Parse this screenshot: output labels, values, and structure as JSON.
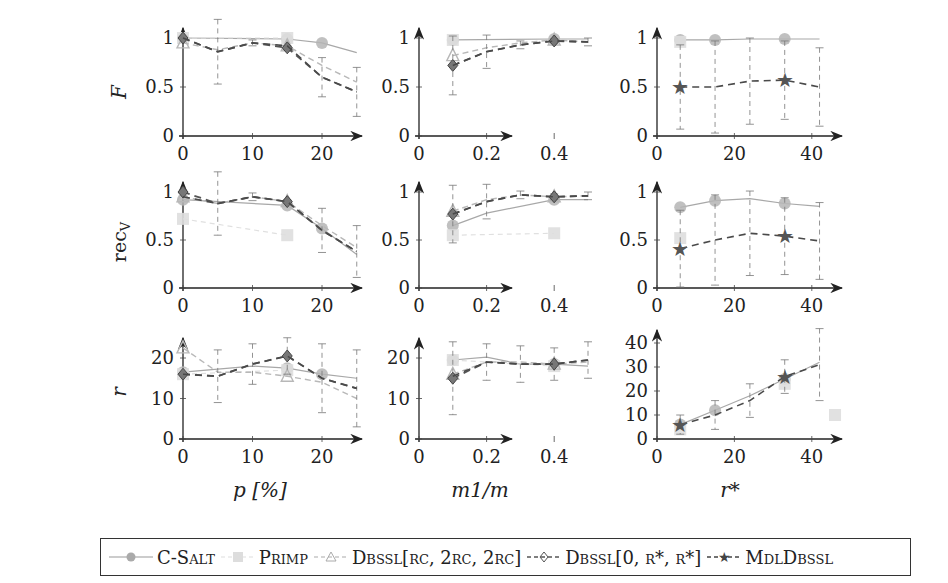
{
  "chart_data": {
    "type": "line",
    "layout": "3x3 grid of line plots with error bars",
    "legend": {
      "position": "bottom",
      "entries": [
        {
          "name": "C-Salt",
          "style": "solid",
          "marker": "circle",
          "color": "#9a9a9a"
        },
        {
          "name": "Primp",
          "style": "dashed",
          "marker": "square",
          "color": "#d8d8d8"
        },
        {
          "name": "Dbssl[r_c, 2r_c, 2r_c]",
          "style": "dashed",
          "marker": "triangle",
          "color": "#b0b0b0"
        },
        {
          "name": "Dbssl[0, r*, r*]",
          "style": "dashed",
          "marker": "diamond",
          "color": "#555555"
        },
        {
          "name": "MdlDbssl",
          "style": "dashed",
          "marker": "star",
          "color": "#444444"
        }
      ]
    },
    "columns": [
      {
        "xlabel": "p [%]",
        "xticks": [
          0,
          10,
          20
        ],
        "xlim": [
          0,
          26
        ]
      },
      {
        "xlabel": "m1/m",
        "xticks": [
          0,
          0.2,
          0.4
        ],
        "xlim": [
          0,
          0.5
        ]
      },
      {
        "xlabel": "r*",
        "xticks": [
          0,
          20,
          40
        ],
        "xlim": [
          0,
          46
        ]
      }
    ],
    "rows": [
      {
        "ylabel": "F",
        "yticks": [
          0,
          0.5,
          1
        ],
        "ylim": [
          0,
          1.05
        ]
      },
      {
        "ylabel": "rec_V",
        "yticks": [
          0,
          0.5,
          1
        ],
        "ylim": [
          0,
          1.05
        ]
      },
      {
        "ylabel": "r",
        "yticks": [
          0,
          10,
          20
        ],
        "ylim": [
          0,
          25
        ]
      }
    ],
    "panels": [
      {
        "row": 0,
        "col": 0,
        "series": [
          {
            "name": "C-Salt",
            "x": [
              0,
              15,
              20,
              25
            ],
            "y": [
              1.0,
              0.99,
              0.95,
              0.85
            ]
          },
          {
            "name": "Primp",
            "x": [
              0,
              15
            ],
            "y": [
              1.0,
              1.0
            ]
          },
          {
            "name": "Dbssl[r_c, 2r_c, 2r_c]",
            "x": [
              0,
              5,
              10,
              15,
              20,
              25
            ],
            "y": [
              0.95,
              0.88,
              0.95,
              0.92,
              0.72,
              0.55
            ]
          },
          {
            "name": "Dbssl[0, r*, r*]",
            "x": [
              0,
              5,
              10,
              15,
              20,
              25
            ],
            "y": [
              1.0,
              0.86,
              0.95,
              0.9,
              0.6,
              0.45
            ],
            "err": [
              0,
              0.33,
              0.03,
              0.02,
              0.2,
              0.25
            ]
          },
          {
            "name": "MdlDbssl",
            "x": [
              0,
              5,
              10,
              15,
              20,
              25
            ],
            "y": [
              1.0,
              0.86,
              0.95,
              0.92,
              0.6,
              0.45
            ]
          }
        ]
      },
      {
        "row": 0,
        "col": 1,
        "series": [
          {
            "name": "C-Salt",
            "x": [
              0.1,
              0.4,
              0.5
            ],
            "y": [
              0.98,
              0.99,
              0.99
            ]
          },
          {
            "name": "Primp",
            "x": [
              0.1
            ],
            "y": [
              0.98
            ]
          },
          {
            "name": "Dbssl[r_c, 2r_c, 2r_c]",
            "x": [
              0.1,
              0.2,
              0.3,
              0.4,
              0.5
            ],
            "y": [
              0.82,
              0.9,
              0.95,
              0.98,
              0.96
            ]
          },
          {
            "name": "Dbssl[0, r*, r*]",
            "x": [
              0.1,
              0.2,
              0.3,
              0.4,
              0.5
            ],
            "y": [
              0.72,
              0.86,
              0.93,
              0.97,
              0.96
            ],
            "err": [
              0.3,
              0.17,
              0.04,
              0.02,
              0.04
            ]
          },
          {
            "name": "MdlDbssl",
            "x": [
              0.1,
              0.2,
              0.3,
              0.4,
              0.5
            ],
            "y": [
              0.72,
              0.86,
              0.93,
              0.97,
              0.96
            ]
          }
        ]
      },
      {
        "row": 0,
        "col": 2,
        "series": [
          {
            "name": "C-Salt",
            "x": [
              6,
              15,
              24,
              33,
              42
            ],
            "y": [
              0.98,
              0.98,
              0.99,
              0.99,
              0.99
            ]
          },
          {
            "name": "Primp",
            "x": [
              6
            ],
            "y": [
              0.96
            ]
          },
          {
            "name": "MdlDbssl",
            "x": [
              6,
              15,
              24,
              33,
              42
            ],
            "y": [
              0.5,
              0.5,
              0.56,
              0.57,
              0.5
            ],
            "err": [
              0.43,
              0.47,
              0.44,
              0.4,
              0.4
            ]
          }
        ]
      },
      {
        "row": 1,
        "col": 0,
        "series": [
          {
            "name": "C-Salt",
            "x": [
              0,
              15,
              20,
              25
            ],
            "y": [
              0.92,
              0.86,
              0.62,
              0.35
            ]
          },
          {
            "name": "Primp",
            "x": [
              0,
              15
            ],
            "y": [
              0.72,
              0.55
            ]
          },
          {
            "name": "Dbssl[r_c, 2r_c, 2r_c]",
            "x": [
              0,
              5,
              10,
              15,
              20,
              25
            ],
            "y": [
              0.95,
              0.88,
              0.95,
              0.9,
              0.65,
              0.42
            ]
          },
          {
            "name": "Dbssl[0, r*, r*]",
            "x": [
              0,
              5,
              10,
              15,
              20,
              25
            ],
            "y": [
              1.0,
              0.88,
              0.95,
              0.9,
              0.6,
              0.38
            ],
            "err": [
              0,
              0.33,
              0.04,
              0.02,
              0.23,
              0.27
            ]
          },
          {
            "name": "MdlDbssl",
            "x": [
              0,
              5,
              10,
              15,
              20,
              25
            ],
            "y": [
              0.95,
              0.88,
              0.95,
              0.9,
              0.6,
              0.38
            ]
          }
        ]
      },
      {
        "row": 1,
        "col": 1,
        "series": [
          {
            "name": "C-Salt",
            "x": [
              0.1,
              0.2,
              0.4,
              0.5
            ],
            "y": [
              0.65,
              0.78,
              0.92,
              0.92
            ]
          },
          {
            "name": "Primp",
            "x": [
              0.1,
              0.4
            ],
            "y": [
              0.55,
              0.57
            ]
          },
          {
            "name": "Dbssl[r_c, 2r_c, 2r_c]",
            "x": [
              0.1,
              0.2,
              0.3,
              0.4,
              0.5
            ],
            "y": [
              0.8,
              0.92,
              0.97,
              0.95,
              0.96
            ]
          },
          {
            "name": "Dbssl[0, r*, r*]",
            "x": [
              0.1,
              0.2,
              0.3,
              0.4,
              0.5
            ],
            "y": [
              0.77,
              0.9,
              0.97,
              0.95,
              0.96
            ],
            "err": [
              0.3,
              0.18,
              0.04,
              0.03,
              0.04
            ]
          },
          {
            "name": "MdlDbssl",
            "x": [
              0.1,
              0.2,
              0.3,
              0.4,
              0.5
            ],
            "y": [
              0.77,
              0.9,
              0.97,
              0.95,
              0.96
            ]
          }
        ]
      },
      {
        "row": 1,
        "col": 2,
        "series": [
          {
            "name": "C-Salt",
            "x": [
              6,
              15,
              24,
              33,
              42
            ],
            "y": [
              0.84,
              0.91,
              0.93,
              0.88,
              0.85
            ]
          },
          {
            "name": "Primp",
            "x": [
              6
            ],
            "y": [
              0.52
            ]
          },
          {
            "name": "MdlDbssl",
            "x": [
              6,
              15,
              24,
              33,
              42
            ],
            "y": [
              0.41,
              0.5,
              0.57,
              0.54,
              0.49
            ],
            "err": [
              0.4,
              0.47,
              0.44,
              0.4,
              0.4
            ]
          }
        ]
      },
      {
        "row": 2,
        "col": 0,
        "series": [
          {
            "name": "C-Salt",
            "x": [
              0,
              10,
              15,
              20,
              25
            ],
            "y": [
              16.5,
              18,
              17.5,
              16,
              15
            ]
          },
          {
            "name": "Primp",
            "x": [
              0,
              15
            ],
            "y": [
              16,
              17
            ]
          },
          {
            "name": "Dbssl[r_c, 2r_c, 2r_c]",
            "x": [
              0,
              5,
              10,
              15,
              20,
              25
            ],
            "y": [
              22.5,
              16.5,
              16.5,
              15.5,
              14,
              10
            ]
          },
          {
            "name": "Dbssl[0, r*, r*]",
            "x": [
              0,
              5,
              10,
              15,
              20,
              25
            ],
            "y": [
              16,
              15.5,
              18.5,
              20.5,
              15,
              12.5
            ],
            "err": [
              0,
              6.5,
              5,
              4.5,
              8.5,
              9.5
            ]
          },
          {
            "name": "MdlDbssl",
            "x": [
              0,
              5,
              10,
              15,
              20,
              25
            ],
            "y": [
              16,
              15.5,
              18.5,
              20.5,
              15,
              12.5
            ]
          }
        ]
      },
      {
        "row": 2,
        "col": 1,
        "series": [
          {
            "name": "C-Salt",
            "x": [
              0.1,
              0.2,
              0.3,
              0.4,
              0.5
            ],
            "y": [
              19.5,
              20.2,
              18.5,
              18.5,
              18
            ]
          },
          {
            "name": "Primp",
            "x": [
              0.1,
              0.4
            ],
            "y": [
              19.5,
              18
            ]
          },
          {
            "name": "Dbssl[r_c, 2r_c, 2r_c]",
            "x": [
              0.1,
              0.2,
              0.3,
              0.4,
              0.5
            ],
            "y": [
              16,
              19,
              19,
              18.5,
              19
            ]
          },
          {
            "name": "Dbssl[0, r*, r*]",
            "x": [
              0.1,
              0.2,
              0.3,
              0.4,
              0.5
            ],
            "y": [
              15,
              19,
              18.5,
              18.5,
              19.5
            ],
            "err": [
              9,
              4.5,
              4.5,
              4,
              4.5
            ]
          },
          {
            "name": "MdlDbssl",
            "x": [
              0.1,
              0.2,
              0.3,
              0.4,
              0.5
            ],
            "y": [
              15.5,
              19,
              18.5,
              18.5,
              19.5
            ]
          }
        ]
      },
      {
        "row": 2,
        "col": 2,
        "series": [
          {
            "name": "C-Salt",
            "x": [
              6,
              15,
              24,
              33,
              42
            ],
            "y": [
              6,
              12,
              18,
              25,
              32
            ]
          },
          {
            "name": "Primp",
            "x": [
              6,
              33,
              46
            ],
            "y": [
              4,
              23,
              10
            ]
          },
          {
            "name": "MdlDbssl",
            "x": [
              6,
              15,
              24,
              33,
              42
            ],
            "y": [
              6,
              10,
              16,
              26,
              31
            ],
            "err": [
              4,
              6,
              7,
              7,
              15
            ]
          }
        ]
      }
    ],
    "yticks_overrides": {
      "row2_col2": [
        0,
        10,
        20,
        30,
        40
      ]
    },
    "ylim_overrides": {
      "row2_col2": [
        0,
        45
      ]
    }
  },
  "labels": {
    "row_titles": [
      "F",
      "rec",
      "r"
    ],
    "row_title_sub": [
      "",
      "V",
      ""
    ],
    "col_titles": [
      "p [%]",
      "m1/m",
      "r*"
    ],
    "ticks": {
      "y01": [
        "0",
        "0.5",
        "1"
      ],
      "y_r": [
        "0",
        "10",
        "20"
      ],
      "y_r40": [
        "0",
        "10",
        "20",
        "30",
        "40"
      ],
      "x_p": [
        "0",
        "10",
        "20"
      ],
      "x_m": [
        "0",
        "0.2",
        "0.4"
      ],
      "x_r": [
        "0",
        "20",
        "40"
      ]
    }
  },
  "legend": {
    "items": [
      {
        "label": "C-Salt"
      },
      {
        "label": "Primp"
      },
      {
        "label": "Dbssl[r",
        "math": "c, 2rc, 2rc]"
      },
      {
        "label": "Dbssl[0, r*, r*]"
      },
      {
        "label": "MdlDbssl"
      }
    ],
    "texts": [
      "C-Salt",
      "Primp",
      "Dbssl[rc, 2rc, 2rc]",
      "Dbssl[0, r*, r*]",
      "MdlDbssl"
    ]
  }
}
